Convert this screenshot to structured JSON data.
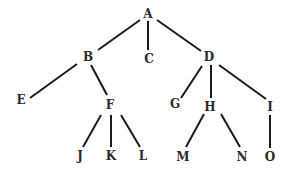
{
  "diagram": {
    "type": "tree",
    "nodes": [
      {
        "id": "A",
        "label": "A",
        "x": 148,
        "y": 14
      },
      {
        "id": "B",
        "label": "B",
        "x": 88,
        "y": 57
      },
      {
        "id": "C",
        "label": "C",
        "x": 149,
        "y": 59
      },
      {
        "id": "D",
        "label": "D",
        "x": 209,
        "y": 57
      },
      {
        "id": "E",
        "label": "E",
        "x": 21,
        "y": 100
      },
      {
        "id": "F",
        "label": "F",
        "x": 110,
        "y": 105
      },
      {
        "id": "G",
        "label": "G",
        "x": 175,
        "y": 104
      },
      {
        "id": "H",
        "label": "H",
        "x": 210,
        "y": 107
      },
      {
        "id": "I",
        "label": "I",
        "x": 270,
        "y": 107
      },
      {
        "id": "J",
        "label": "J",
        "x": 80,
        "y": 156
      },
      {
        "id": "K",
        "label": "K",
        "x": 111,
        "y": 156
      },
      {
        "id": "L",
        "label": "L",
        "x": 143,
        "y": 156
      },
      {
        "id": "M",
        "label": "M",
        "x": 183,
        "y": 157
      },
      {
        "id": "N",
        "label": "N",
        "x": 242,
        "y": 157
      },
      {
        "id": "O",
        "label": "O",
        "x": 270,
        "y": 157
      }
    ],
    "edges": [
      {
        "from": "A",
        "to": "B",
        "x1": 140,
        "y1": 20,
        "x2": 98,
        "y2": 50
      },
      {
        "from": "A",
        "to": "C",
        "x1": 148,
        "y1": 21,
        "x2": 148,
        "y2": 50
      },
      {
        "from": "A",
        "to": "D",
        "x1": 157,
        "y1": 20,
        "x2": 201,
        "y2": 51
      },
      {
        "from": "B",
        "to": "E",
        "x1": 77,
        "y1": 64,
        "x2": 30,
        "y2": 98
      },
      {
        "from": "B",
        "to": "F",
        "x1": 91,
        "y1": 65,
        "x2": 107,
        "y2": 95
      },
      {
        "from": "D",
        "to": "G",
        "x1": 202,
        "y1": 66,
        "x2": 181,
        "y2": 98
      },
      {
        "from": "D",
        "to": "H",
        "x1": 211,
        "y1": 65,
        "x2": 211,
        "y2": 98
      },
      {
        "from": "D",
        "to": "I",
        "x1": 219,
        "y1": 65,
        "x2": 266,
        "y2": 99
      },
      {
        "from": "F",
        "to": "J",
        "x1": 101,
        "y1": 115,
        "x2": 83,
        "y2": 147
      },
      {
        "from": "F",
        "to": "K",
        "x1": 111,
        "y1": 115,
        "x2": 111,
        "y2": 147
      },
      {
        "from": "F",
        "to": "L",
        "x1": 121,
        "y1": 115,
        "x2": 140,
        "y2": 147
      },
      {
        "from": "H",
        "to": "M",
        "x1": 204,
        "y1": 114,
        "x2": 186,
        "y2": 147
      },
      {
        "from": "H",
        "to": "N",
        "x1": 221,
        "y1": 114,
        "x2": 240,
        "y2": 147
      },
      {
        "from": "I",
        "to": "O",
        "x1": 270,
        "y1": 115,
        "x2": 270,
        "y2": 148
      }
    ]
  }
}
